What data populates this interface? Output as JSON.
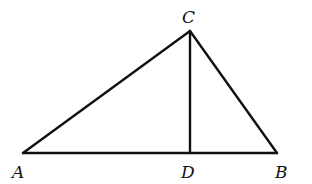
{
  "diagram": {
    "type": "triangle-with-altitude",
    "points": {
      "A": {
        "label": "A",
        "x": 23,
        "y": 153,
        "label_x": 12,
        "label_y": 178
      },
      "B": {
        "label": "B",
        "x": 277,
        "y": 153,
        "label_x": 275,
        "label_y": 178
      },
      "C": {
        "label": "C",
        "x": 190,
        "y": 31,
        "label_x": 182,
        "label_y": 23
      },
      "D": {
        "label": "D",
        "x": 190,
        "y": 153,
        "label_x": 181,
        "label_y": 178
      }
    },
    "segments": [
      {
        "name": "AC",
        "from": "A",
        "to": "C"
      },
      {
        "name": "CB",
        "from": "C",
        "to": "B"
      },
      {
        "name": "AB",
        "from": "A",
        "to": "B"
      },
      {
        "name": "CD",
        "from": "C",
        "to": "D"
      }
    ],
    "stroke_color": "#111111",
    "background": "#ffffff"
  }
}
